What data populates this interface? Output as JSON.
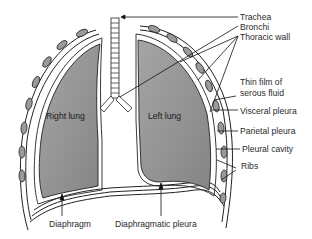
{
  "diagram": {
    "type": "anatomical-diagram",
    "lung_labels": {
      "right": "Right lung",
      "left": "Left lung"
    },
    "callouts_right": [
      {
        "id": "trachea",
        "text": "Trachea"
      },
      {
        "id": "bronchi",
        "text": "Bronchi"
      },
      {
        "id": "thoracic-wall",
        "text": "Thoracic wall"
      },
      {
        "id": "thin-film-1",
        "text": "Thin film of"
      },
      {
        "id": "thin-film-2",
        "text": "serous fluid"
      },
      {
        "id": "visceral-pleura",
        "text": "Visceral pleura"
      },
      {
        "id": "parietal-pleura",
        "text": "Parietal pleura"
      },
      {
        "id": "pleural-cavity",
        "text": "Pleural cavity"
      },
      {
        "id": "ribs",
        "text": "Ribs"
      }
    ],
    "callouts_bottom": [
      {
        "id": "diaphragm",
        "text": "Diaphragm"
      },
      {
        "id": "diaphragmatic-pleura",
        "text": "Diaphragmatic pleura"
      }
    ],
    "colors": {
      "lung_fill": "#8f8f8f",
      "lung_fill_light": "#a8a8a8",
      "outline": "#222222",
      "background": "#ffffff"
    }
  }
}
